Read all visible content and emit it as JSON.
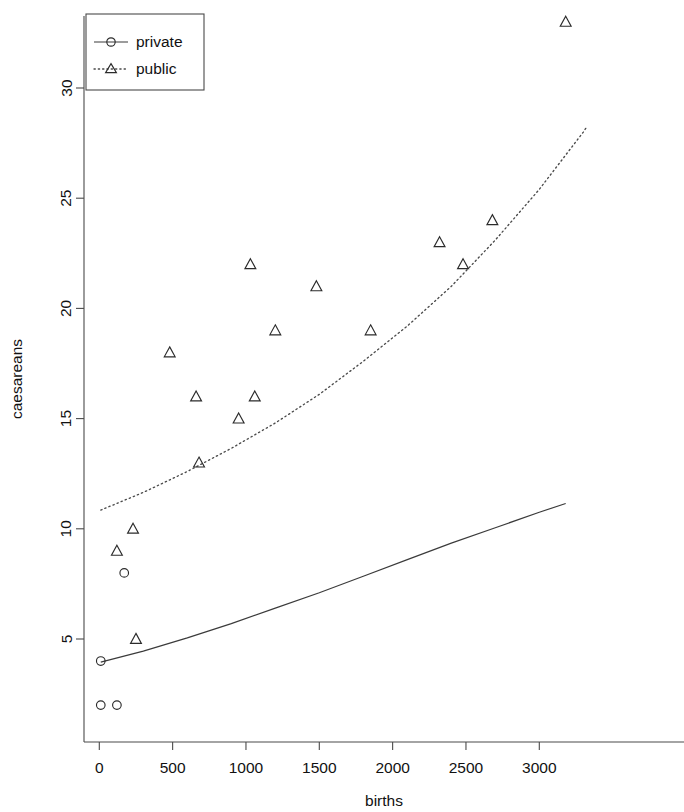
{
  "chart_data": {
    "type": "scatter",
    "title": "",
    "xlabel": "births",
    "ylabel": "caesareans",
    "xlim": [
      -60,
      3320
    ],
    "ylim": [
      1.2,
      33.6
    ],
    "xticks": [
      0,
      500,
      1000,
      1500,
      2000,
      2500,
      3000
    ],
    "xticklabels": [
      "0",
      "500",
      "1000",
      "1500",
      "2000",
      "2500",
      "3000"
    ],
    "yticks": [
      5,
      10,
      15,
      20,
      25,
      30
    ],
    "yticklabels": [
      "5",
      "10",
      "15",
      "20",
      "25",
      "30"
    ],
    "grid": false,
    "legend_position": "top-left",
    "series": [
      {
        "name": "private",
        "marker": "circle",
        "linestyle": "solid",
        "color": "#2b2b2b",
        "points": [
          {
            "x": 10,
            "y": 4
          },
          {
            "x": 10,
            "y": 2
          },
          {
            "x": 120,
            "y": 2
          },
          {
            "x": 170,
            "y": 8
          }
        ],
        "fit_curve": [
          {
            "x": 10,
            "y": 3.95
          },
          {
            "x": 300,
            "y": 4.45
          },
          {
            "x": 600,
            "y": 5.05
          },
          {
            "x": 900,
            "y": 5.7
          },
          {
            "x": 1200,
            "y": 6.4
          },
          {
            "x": 1500,
            "y": 7.1
          },
          {
            "x": 1800,
            "y": 7.85
          },
          {
            "x": 2100,
            "y": 8.6
          },
          {
            "x": 2400,
            "y": 9.35
          },
          {
            "x": 2700,
            "y": 10.05
          },
          {
            "x": 3000,
            "y": 10.75
          },
          {
            "x": 3180,
            "y": 11.15
          }
        ]
      },
      {
        "name": "public",
        "marker": "triangle",
        "linestyle": "dotted",
        "color": "#2b2b2b",
        "points": [
          {
            "x": 120,
            "y": 9
          },
          {
            "x": 230,
            "y": 10
          },
          {
            "x": 250,
            "y": 5
          },
          {
            "x": 480,
            "y": 18
          },
          {
            "x": 660,
            "y": 16
          },
          {
            "x": 680,
            "y": 13
          },
          {
            "x": 950,
            "y": 15
          },
          {
            "x": 1030,
            "y": 22
          },
          {
            "x": 1060,
            "y": 16
          },
          {
            "x": 1200,
            "y": 19
          },
          {
            "x": 1480,
            "y": 21
          },
          {
            "x": 1850,
            "y": 19
          },
          {
            "x": 2320,
            "y": 23
          },
          {
            "x": 2480,
            "y": 22
          },
          {
            "x": 2680,
            "y": 24
          },
          {
            "x": 3180,
            "y": 33
          }
        ],
        "fit_curve": [
          {
            "x": 10,
            "y": 10.85
          },
          {
            "x": 300,
            "y": 11.65
          },
          {
            "x": 600,
            "y": 12.6
          },
          {
            "x": 900,
            "y": 13.65
          },
          {
            "x": 1200,
            "y": 14.8
          },
          {
            "x": 1500,
            "y": 16.1
          },
          {
            "x": 1800,
            "y": 17.6
          },
          {
            "x": 2100,
            "y": 19.2
          },
          {
            "x": 2400,
            "y": 21.0
          },
          {
            "x": 2700,
            "y": 23.1
          },
          {
            "x": 3000,
            "y": 25.4
          },
          {
            "x": 3300,
            "y": 28.0
          },
          {
            "x": 3320,
            "y": 28.2
          }
        ]
      }
    ]
  },
  "legend": {
    "entries": [
      {
        "label": "private",
        "marker": "circle",
        "linestyle": "solid"
      },
      {
        "label": "public",
        "marker": "triangle",
        "linestyle": "dotted"
      }
    ]
  }
}
